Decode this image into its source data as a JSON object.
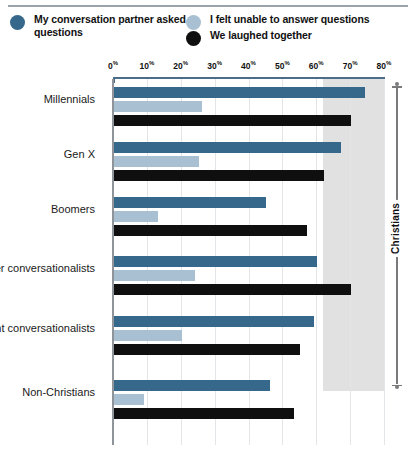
{
  "legend": {
    "entries": [
      {
        "label": "My conversation partner asked questions",
        "color": "#36688c",
        "icon": "circle-swatch"
      },
      {
        "label": "I felt unable to answer questions",
        "color": "#a8c0d2",
        "icon": "circle-swatch"
      },
      {
        "label": "We laughed together",
        "color": "#100f0f",
        "icon": "circle-swatch"
      }
    ]
  },
  "bracket": {
    "label": "Christians"
  },
  "chart_data": {
    "type": "bar",
    "orientation": "horizontal",
    "title": "",
    "xlabel": "",
    "ylabel": "",
    "xlim": [
      0,
      80
    ],
    "grid": true,
    "legend_position": "top",
    "tick_labels": [
      "0%",
      "10%",
      "20%",
      "30%",
      "40%",
      "50%",
      "60%",
      "70%",
      "80%"
    ],
    "ticks": [
      0,
      10,
      20,
      30,
      40,
      50,
      60,
      70,
      80
    ],
    "categories": [
      "Millennials",
      "Gen X",
      "Boomers",
      "Eager conversationalists",
      "Reluctant conversationalists",
      "Non-Christians"
    ],
    "series": [
      {
        "name": "My conversation partner asked questions",
        "color": "#36688c",
        "values": [
          74,
          67,
          45,
          60,
          59,
          46
        ]
      },
      {
        "name": "I felt unable to answer questions",
        "color": "#a8c0d2",
        "values": [
          26,
          25,
          13,
          24,
          20,
          9
        ]
      },
      {
        "name": "We laughed together",
        "color": "#100f0f",
        "values": [
          70,
          62,
          57,
          70,
          55,
          53
        ]
      }
    ]
  }
}
